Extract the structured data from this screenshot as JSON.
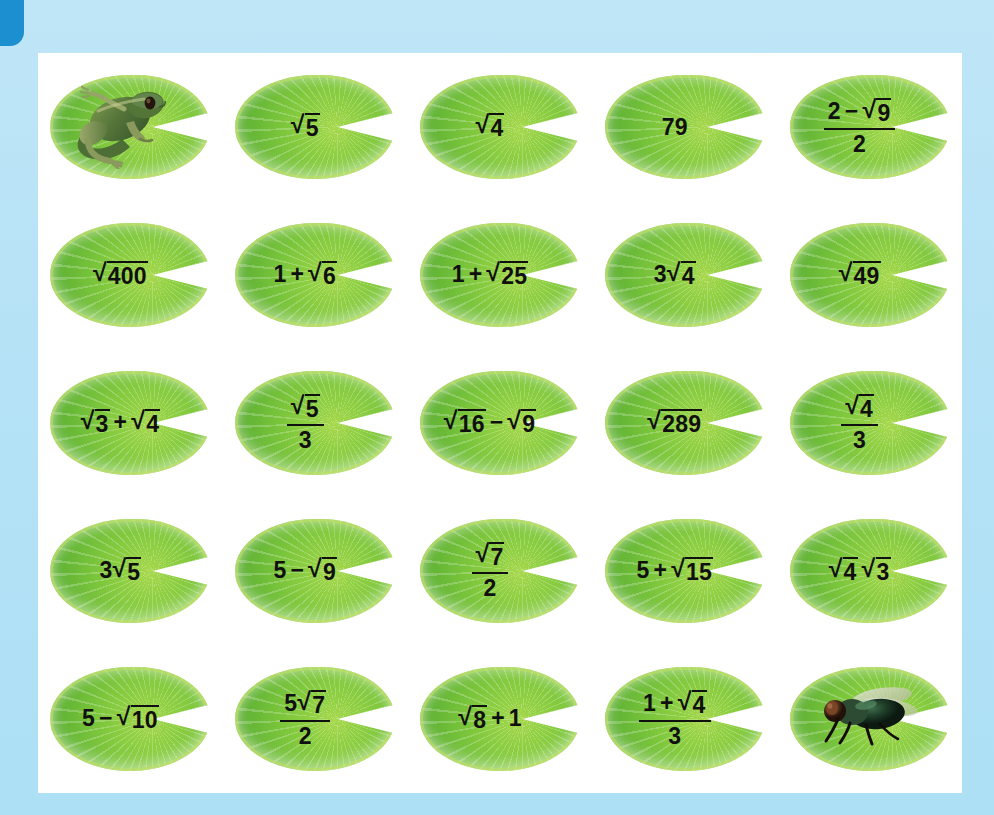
{
  "page": {
    "background_color": "#b3e1f5",
    "card_color": "#ffffff",
    "tab_color": "#1b8fd0",
    "pad_color": "#7cc63c",
    "text_color": "#101010"
  },
  "grid": {
    "columns": 5,
    "rows": 5,
    "cells": [
      {
        "id": "r1c1",
        "kind": "frog",
        "icon": "frog-icon",
        "label": "frog"
      },
      {
        "id": "r1c2",
        "kind": "expr",
        "text": "√5",
        "parts": [
          {
            "t": "radical",
            "radicand": "5"
          }
        ]
      },
      {
        "id": "r1c3",
        "kind": "expr",
        "text": "√4",
        "parts": [
          {
            "t": "radical",
            "radicand": "4"
          }
        ]
      },
      {
        "id": "r1c4",
        "kind": "expr",
        "text": "79",
        "parts": [
          {
            "t": "plain",
            "v": "79"
          }
        ]
      },
      {
        "id": "r1c5",
        "kind": "expr",
        "text": "(2 − √9)/2",
        "parts": [
          {
            "t": "fraction",
            "num": [
              {
                "t": "plain",
                "v": "2"
              },
              {
                "t": "op",
                "v": "−"
              },
              {
                "t": "radical",
                "radicand": "9"
              }
            ],
            "den": [
              {
                "t": "plain",
                "v": "2"
              }
            ]
          }
        ]
      },
      {
        "id": "r2c1",
        "kind": "expr",
        "text": "√400",
        "parts": [
          {
            "t": "radical",
            "radicand": "400"
          }
        ]
      },
      {
        "id": "r2c2",
        "kind": "expr",
        "text": "1 + √6",
        "parts": [
          {
            "t": "plain",
            "v": "1"
          },
          {
            "t": "op",
            "v": "+"
          },
          {
            "t": "radical",
            "radicand": "6"
          }
        ]
      },
      {
        "id": "r2c3",
        "kind": "expr",
        "text": "1 + √25",
        "parts": [
          {
            "t": "plain",
            "v": "1"
          },
          {
            "t": "op",
            "v": "+"
          },
          {
            "t": "radical",
            "radicand": "25"
          }
        ]
      },
      {
        "id": "r2c4",
        "kind": "expr",
        "text": "3√4",
        "parts": [
          {
            "t": "plain",
            "v": "3"
          },
          {
            "t": "radical",
            "radicand": "4"
          }
        ]
      },
      {
        "id": "r2c5",
        "kind": "expr",
        "text": "√49",
        "parts": [
          {
            "t": "radical",
            "radicand": "49"
          }
        ]
      },
      {
        "id": "r3c1",
        "kind": "expr",
        "text": "√3 + √4",
        "parts": [
          {
            "t": "radical",
            "radicand": "3"
          },
          {
            "t": "op",
            "v": "+"
          },
          {
            "t": "radical",
            "radicand": "4"
          }
        ]
      },
      {
        "id": "r3c2",
        "kind": "expr",
        "text": "√5/3",
        "parts": [
          {
            "t": "fraction",
            "num": [
              {
                "t": "radical",
                "radicand": "5"
              }
            ],
            "den": [
              {
                "t": "plain",
                "v": "3"
              }
            ]
          }
        ]
      },
      {
        "id": "r3c3",
        "kind": "expr",
        "text": "√16 − √9",
        "parts": [
          {
            "t": "radical",
            "radicand": "16"
          },
          {
            "t": "op",
            "v": "−"
          },
          {
            "t": "radical",
            "radicand": "9"
          }
        ]
      },
      {
        "id": "r3c4",
        "kind": "expr",
        "text": "√289",
        "parts": [
          {
            "t": "radical",
            "radicand": "289"
          }
        ]
      },
      {
        "id": "r3c5",
        "kind": "expr",
        "text": "√4/3",
        "parts": [
          {
            "t": "fraction",
            "num": [
              {
                "t": "radical",
                "radicand": "4"
              }
            ],
            "den": [
              {
                "t": "plain",
                "v": "3"
              }
            ]
          }
        ]
      },
      {
        "id": "r4c1",
        "kind": "expr",
        "text": "3√5",
        "parts": [
          {
            "t": "plain",
            "v": "3"
          },
          {
            "t": "radical",
            "radicand": "5"
          }
        ]
      },
      {
        "id": "r4c2",
        "kind": "expr",
        "text": "5 − √9",
        "parts": [
          {
            "t": "plain",
            "v": "5"
          },
          {
            "t": "op",
            "v": "−"
          },
          {
            "t": "radical",
            "radicand": "9"
          }
        ]
      },
      {
        "id": "r4c3",
        "kind": "expr",
        "text": "√7/2",
        "parts": [
          {
            "t": "fraction",
            "num": [
              {
                "t": "radical",
                "radicand": "7"
              }
            ],
            "den": [
              {
                "t": "plain",
                "v": "2"
              }
            ]
          }
        ]
      },
      {
        "id": "r4c4",
        "kind": "expr",
        "text": "5 + √15",
        "parts": [
          {
            "t": "plain",
            "v": "5"
          },
          {
            "t": "op",
            "v": "+"
          },
          {
            "t": "radical",
            "radicand": "15"
          }
        ]
      },
      {
        "id": "r4c5",
        "kind": "expr",
        "text": "√4 √3",
        "parts": [
          {
            "t": "radical",
            "radicand": "4"
          },
          {
            "t": "gap"
          },
          {
            "t": "radical",
            "radicand": "3"
          }
        ]
      },
      {
        "id": "r5c1",
        "kind": "expr",
        "text": "5 − √10",
        "parts": [
          {
            "t": "plain",
            "v": "5"
          },
          {
            "t": "op",
            "v": "−"
          },
          {
            "t": "radical",
            "radicand": "10"
          }
        ]
      },
      {
        "id": "r5c2",
        "kind": "expr",
        "text": "5√7/2",
        "parts": [
          {
            "t": "fraction",
            "num": [
              {
                "t": "plain",
                "v": "5"
              },
              {
                "t": "radical",
                "radicand": "7"
              }
            ],
            "den": [
              {
                "t": "plain",
                "v": "2"
              }
            ]
          }
        ]
      },
      {
        "id": "r5c3",
        "kind": "expr",
        "text": "√8 + 1",
        "parts": [
          {
            "t": "radical",
            "radicand": "8"
          },
          {
            "t": "op",
            "v": "+"
          },
          {
            "t": "plain",
            "v": "1"
          }
        ]
      },
      {
        "id": "r5c4",
        "kind": "expr",
        "text": "(1 + √4)/3",
        "parts": [
          {
            "t": "fraction",
            "num": [
              {
                "t": "plain",
                "v": "1"
              },
              {
                "t": "op",
                "v": "+"
              },
              {
                "t": "radical",
                "radicand": "4"
              }
            ],
            "den": [
              {
                "t": "plain",
                "v": "3"
              }
            ]
          }
        ]
      },
      {
        "id": "r5c5",
        "kind": "fly",
        "icon": "fly-icon",
        "label": "fly"
      }
    ]
  }
}
